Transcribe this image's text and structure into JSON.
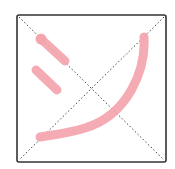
{
  "practice_grid": {
    "box": {
      "x": 17,
      "y": 15,
      "width": 149,
      "height": 147,
      "border_color": "#333333",
      "border_radius": 2
    },
    "guide_color": "#444444",
    "stroke_color": "#f4a3ab",
    "stroke_width": 9
  },
  "character": {
    "strokes": [
      {
        "name": "stroke-1",
        "d": "M41 39 L65 61"
      },
      {
        "name": "stroke-2",
        "d": "M36 70 L57 90"
      },
      {
        "name": "stroke-3",
        "d": "M144 37 C146 70 128 115 85 128 C70 133 52 135 40 137"
      }
    ]
  }
}
